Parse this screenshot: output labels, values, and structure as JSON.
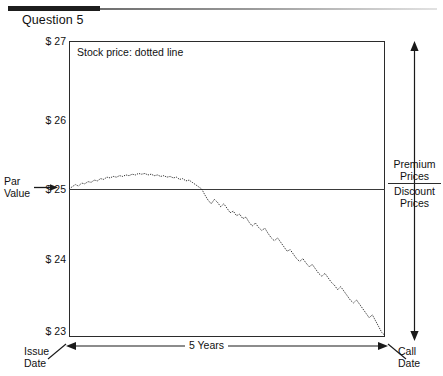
{
  "header": {
    "title": "Question 5"
  },
  "chart_data": {
    "type": "line",
    "title": "Question 5",
    "annotation": "Stock price: dotted line",
    "xlabel": "5 Years",
    "ylabel": "",
    "ylim": [
      23,
      27
    ],
    "yticks": [
      "$ 27",
      "$ 26",
      "$ 25",
      "$ 24",
      "$ 23"
    ],
    "ytick_values": [
      27,
      26,
      25,
      24,
      23
    ],
    "grid": false,
    "legend": "none",
    "reference_line": {
      "value": 25,
      "label": "Par Value",
      "label_lines": [
        "Par",
        "Value"
      ]
    },
    "x_axis_endpoints": {
      "left": [
        "Issue",
        "Date"
      ],
      "right": [
        "Call",
        "Date"
      ],
      "span_label": "5 Years"
    },
    "right_axis": {
      "above_label": [
        "Premium",
        "Prices"
      ],
      "below_label": [
        "Discount",
        "Prices"
      ],
      "arrow": "double-headed-vertical"
    },
    "series": [
      {
        "name": "Stock price",
        "style": "dotted",
        "x": [
          0,
          1,
          2,
          3,
          4,
          5,
          6,
          7,
          8,
          9,
          10,
          11,
          12,
          13,
          14,
          15,
          16,
          17,
          18,
          19,
          20,
          21,
          22,
          23,
          24,
          25,
          26,
          27,
          28,
          29,
          30,
          31,
          32,
          33,
          34,
          35,
          36,
          37,
          38,
          39,
          40,
          41,
          42,
          43,
          44,
          45,
          46,
          47,
          48,
          49,
          50,
          51,
          52,
          53,
          54,
          55,
          56,
          57,
          58,
          59,
          60,
          61,
          62,
          63,
          64,
          65,
          66,
          67,
          68,
          69,
          70,
          71,
          72,
          73,
          74,
          75,
          76,
          77,
          78,
          79,
          80,
          81,
          82,
          83,
          84,
          85,
          86,
          87,
          88,
          89,
          90,
          91,
          92,
          93,
          94,
          95,
          96,
          97,
          98,
          99,
          100
        ],
        "values": [
          25.0,
          25.03,
          25.06,
          25.04,
          25.08,
          25.07,
          25.1,
          25.09,
          25.12,
          25.11,
          25.14,
          25.13,
          25.16,
          25.15,
          25.17,
          25.16,
          25.18,
          25.17,
          25.19,
          25.18,
          25.2,
          25.19,
          25.21,
          25.2,
          25.21,
          25.19,
          25.2,
          25.18,
          25.19,
          25.17,
          25.18,
          25.16,
          25.17,
          25.15,
          25.16,
          25.13,
          25.14,
          25.11,
          25.12,
          25.09,
          25.06,
          25.03,
          25.0,
          24.92,
          24.85,
          24.8,
          24.86,
          24.82,
          24.76,
          24.8,
          24.74,
          24.68,
          24.7,
          24.64,
          24.66,
          24.6,
          24.62,
          24.55,
          24.5,
          24.54,
          24.48,
          24.44,
          24.47,
          24.4,
          24.34,
          24.3,
          24.34,
          24.28,
          24.22,
          24.16,
          24.18,
          24.12,
          24.06,
          24.02,
          24.06,
          24.0,
          23.95,
          23.98,
          23.92,
          23.86,
          23.82,
          23.86,
          23.8,
          23.74,
          23.7,
          23.64,
          23.68,
          23.62,
          23.56,
          23.5,
          23.46,
          23.5,
          23.44,
          23.38,
          23.32,
          23.26,
          23.3,
          23.22,
          23.14,
          23.06,
          23.02
        ]
      }
    ]
  },
  "labels": {
    "plot_note": "Stock price: dotted line",
    "par_line1": "Par",
    "par_line2": "Value",
    "issue_line1": "Issue",
    "issue_line2": "Date",
    "call_line1": "Call",
    "call_line2": "Date",
    "years": "5 Years",
    "premium_line1": "Premium",
    "premium_line2": "Prices",
    "discount_line1": "Discount",
    "discount_line2": "Prices",
    "y27": "$ 27",
    "y26": "$ 26",
    "y25": "$ 25",
    "y24": "$ 24",
    "y23": "$ 23"
  },
  "colors": {
    "ink": "#1a1a1a",
    "frame": "#2b2b2b",
    "rule": "#1d1d1d"
  }
}
